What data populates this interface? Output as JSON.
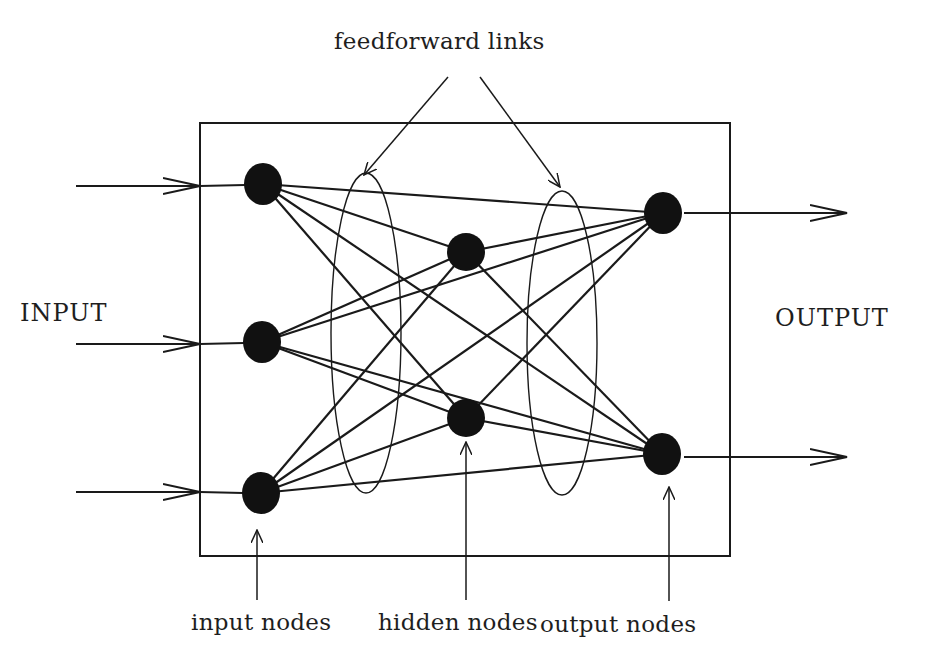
{
  "labels": {
    "title_annotation": "feedforward links",
    "input": "INPUT",
    "output": "OUTPUT",
    "input_nodes": "input nodes",
    "hidden_nodes": "hidden nodes",
    "output_nodes": "output nodes"
  },
  "colors": {
    "background": "#ffffff",
    "ink": "#1a1a1a"
  },
  "network": {
    "box": {
      "x": 200,
      "y": 123,
      "w": 530,
      "h": 433
    },
    "input_nodes": [
      {
        "id": "i1",
        "cx": 263,
        "cy": 184
      },
      {
        "id": "i2",
        "cx": 262,
        "cy": 342
      },
      {
        "id": "i3",
        "cx": 261,
        "cy": 493
      }
    ],
    "hidden_nodes": [
      {
        "id": "h1",
        "cx": 466,
        "cy": 252
      },
      {
        "id": "h2",
        "cx": 466,
        "cy": 418
      }
    ],
    "output_nodes": [
      {
        "id": "o1",
        "cx": 663,
        "cy": 213
      },
      {
        "id": "o2",
        "cx": 662,
        "cy": 454
      }
    ],
    "input_arrows": [
      {
        "y": 186,
        "x1": 76,
        "x2": 200
      },
      {
        "y": 344,
        "x1": 76,
        "x2": 200
      },
      {
        "y": 492,
        "x1": 76,
        "x2": 200
      }
    ],
    "output_arrows": [
      {
        "y": 213,
        "x1": 684,
        "x2": 847
      },
      {
        "y": 457,
        "x1": 684,
        "x2": 847
      }
    ],
    "feedforward_ellipses": [
      {
        "cx": 366,
        "cy": 333,
        "rx": 35,
        "ry": 160
      },
      {
        "cx": 562,
        "cy": 343,
        "rx": 35,
        "ry": 152
      }
    ]
  }
}
